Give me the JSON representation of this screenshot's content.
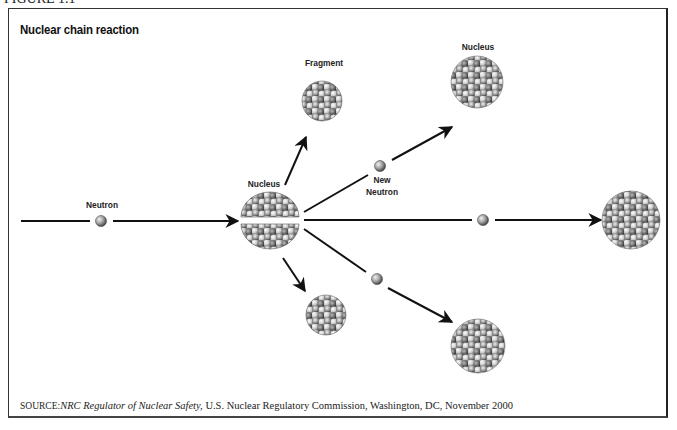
{
  "figure_label": "FIGURE 1.1",
  "title": "Nuclear chain reaction",
  "labels": {
    "neutron": "Neutron",
    "nucleus_center": "Nucleus",
    "fragment": "Fragment",
    "new_neutron_line1": "New",
    "new_neutron_line2": "Neutron",
    "nucleus_top": "Nucleus"
  },
  "source": {
    "prefix": "SOURCE:",
    "publication": "NRC Regulator of Nuclear Safety,",
    "rest": " U.S. Nuclear Regulatory Commission, Washington, DC, November 2000"
  },
  "colors": {
    "line": "#111111",
    "sphere_light": "#e6e6e6",
    "sphere_dark": "#555555",
    "frame": "#333333"
  }
}
